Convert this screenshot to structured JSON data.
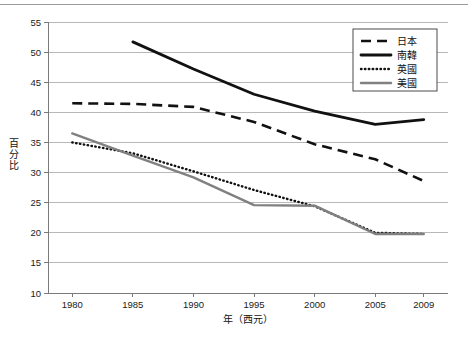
{
  "caption": {
    "text": "圖一　日、韓、英、美四國製造業就業人口占全國就業人口比率變化"
  },
  "chart_data": {
    "type": "line",
    "title": "",
    "xlabel": "年（西元）",
    "ylabel": "百分比",
    "xlim": [
      1978,
      2011
    ],
    "ylim": [
      10,
      55
    ],
    "ytick_step": 5,
    "yticks": [
      10,
      15,
      20,
      25,
      30,
      35,
      40,
      45,
      50,
      55
    ],
    "xticks": [
      1980,
      1985,
      1990,
      1995,
      2000,
      2005,
      2009
    ],
    "grid": "horizontal",
    "legend_position": "top-right",
    "series": [
      {
        "name": "日本",
        "style": "dashed",
        "color": "#111111",
        "x": [
          1980,
          1985,
          1990,
          1995,
          2000,
          2005,
          2009
        ],
        "values": [
          41.5,
          41.4,
          40.9,
          38.4,
          34.7,
          32.2,
          28.6
        ]
      },
      {
        "name": "南韓",
        "style": "solid-thick",
        "color": "#111111",
        "x": [
          1985,
          1990,
          1995,
          2000,
          2005,
          2009
        ],
        "values": [
          51.7,
          47.2,
          43.0,
          40.2,
          38.0,
          38.8
        ]
      },
      {
        "name": "英國",
        "style": "dotted",
        "color": "#111111",
        "x": [
          1980,
          1985,
          1990,
          1995,
          2000,
          2005,
          2009
        ],
        "values": [
          35.0,
          33.2,
          30.2,
          27.1,
          24.4,
          20.0,
          19.8
        ]
      },
      {
        "name": "美國",
        "style": "solid-gray",
        "color": "#808080",
        "x": [
          1980,
          1985,
          1990,
          1995,
          2000,
          2005,
          2009
        ],
        "values": [
          36.5,
          32.8,
          29.2,
          24.6,
          24.5,
          19.8,
          19.8
        ]
      }
    ]
  },
  "legend": {
    "items": [
      {
        "label": "日本"
      },
      {
        "label": "南韓"
      },
      {
        "label": "英國"
      },
      {
        "label": "美國"
      }
    ]
  }
}
